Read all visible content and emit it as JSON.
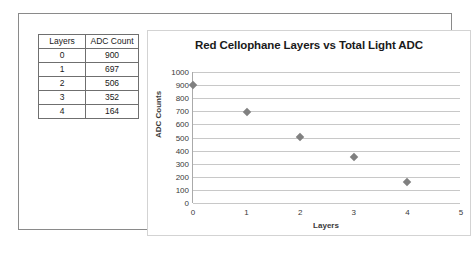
{
  "table": {
    "headers": [
      "Layers",
      "ADC Count"
    ],
    "rows": [
      [
        "0",
        "900"
      ],
      [
        "1",
        "697"
      ],
      [
        "2",
        "506"
      ],
      [
        "3",
        "352"
      ],
      [
        "4",
        "164"
      ]
    ]
  },
  "chart_data": {
    "type": "scatter",
    "title": "Red Cellophane Layers vs Total Light ADC",
    "xlabel": "Layers",
    "ylabel": "ADC Counts",
    "x": [
      0,
      1,
      2,
      3,
      4
    ],
    "values": [
      900,
      697,
      506,
      352,
      164
    ],
    "xlim": [
      0,
      5
    ],
    "ylim": [
      0,
      1000
    ],
    "xticks": [
      "0",
      "1",
      "2",
      "3",
      "4",
      "5"
    ],
    "yticks": [
      "0",
      "100",
      "200",
      "300",
      "400",
      "500",
      "600",
      "700",
      "800",
      "900",
      "1000"
    ],
    "grid": "horizontal",
    "legend": "none",
    "marker_color": "#808080",
    "marker_shape": "diamond"
  }
}
